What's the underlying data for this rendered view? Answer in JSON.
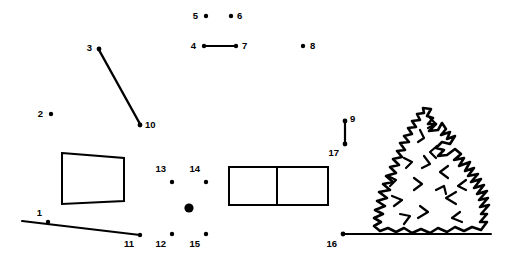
{
  "image": {
    "title": "Connect-the-dots puzzle worksheet",
    "subject": "evergreen pine tree with numbered dots",
    "width": 516,
    "height": 264,
    "background_color": "#ffffff",
    "ink_color": "#000000"
  },
  "dots": [
    {
      "number": "1",
      "x": 48,
      "y": 222,
      "label_x": 42,
      "label_y": 216,
      "r": 2.2
    },
    {
      "number": "2",
      "x": 51,
      "y": 114,
      "label_x": 43,
      "label_y": 117,
      "r": 2.2
    },
    {
      "number": "3",
      "x": 99,
      "y": 49,
      "label_x": 92,
      "label_y": 51,
      "r": 2.4
    },
    {
      "number": "4",
      "x": 204,
      "y": 46,
      "label_x": 196,
      "label_y": 49,
      "r": 2.2
    },
    {
      "number": "5",
      "x": 206,
      "y": 16,
      "label_x": 198,
      "label_y": 19,
      "r": 2.2
    },
    {
      "number": "6",
      "x": 231,
      "y": 16,
      "label_x": 237,
      "label_y": 19,
      "r": 2.2
    },
    {
      "number": "7",
      "x": 236,
      "y": 46,
      "label_x": 242,
      "label_y": 49,
      "r": 2.2
    },
    {
      "number": "8",
      "x": 303,
      "y": 46,
      "label_x": 310,
      "label_y": 49,
      "r": 2.2
    },
    {
      "number": "9",
      "x": 345,
      "y": 121,
      "label_x": 350,
      "label_y": 122,
      "r": 2.4
    },
    {
      "number": "10",
      "x": 140,
      "y": 125,
      "label_x": 145,
      "label_y": 128,
      "r": 2.4
    },
    {
      "number": "11",
      "x": 140,
      "y": 235,
      "label_x": 134,
      "label_y": 247,
      "r": 2.2
    },
    {
      "number": "12",
      "x": 172,
      "y": 234,
      "label_x": 166,
      "label_y": 247,
      "r": 2.2
    },
    {
      "number": "13",
      "x": 172,
      "y": 182,
      "label_x": 166,
      "label_y": 172,
      "r": 2.2
    },
    {
      "number": "14",
      "x": 206,
      "y": 182,
      "label_x": 200,
      "label_y": 172,
      "r": 2.2
    },
    {
      "number": "15",
      "x": 206,
      "y": 234,
      "label_x": 200,
      "label_y": 247,
      "r": 2.2
    },
    {
      "number": "16",
      "x": 343,
      "y": 234,
      "label_x": 337,
      "label_y": 247,
      "r": 2.4
    },
    {
      "number": "17",
      "x": 345,
      "y": 144,
      "label_x": 339,
      "label_y": 156,
      "r": 2.4
    }
  ],
  "unnumbered_marks": [
    {
      "name": "large-center-dot",
      "x": 189,
      "y": 208,
      "r": 4.6
    }
  ],
  "connector_lines": [
    {
      "name": "line-3-to-10",
      "from": "3",
      "to": "10",
      "x1": 99,
      "y1": 50,
      "x2": 140,
      "y2": 124,
      "width": 2.4
    },
    {
      "name": "line-4-to-7",
      "from": "4",
      "to": "7",
      "x1": 205,
      "y1": 46,
      "x2": 235,
      "y2": 46,
      "width": 2.2
    },
    {
      "name": "line-9-to-17",
      "from": "9",
      "to": "17",
      "x1": 345,
      "y1": 122,
      "x2": 345,
      "y2": 143,
      "width": 2.2
    }
  ],
  "free_lines": [
    {
      "name": "ground-line-left",
      "x1": 22,
      "y1": 221,
      "x2": 140,
      "y2": 235,
      "width": 2.0
    },
    {
      "name": "ground-line-right",
      "x1": 343,
      "y1": 234,
      "x2": 491,
      "y2": 234,
      "width": 2.0
    }
  ],
  "shapes": [
    {
      "name": "quadrilateral-left",
      "type": "polygon",
      "points": "62,153 124,158 124,201 62,204",
      "stroke_width": 2.0
    },
    {
      "name": "rectangle-right",
      "type": "rect",
      "x": 229,
      "y": 167,
      "width": 99,
      "height": 38,
      "stroke_width": 2.0
    },
    {
      "name": "rectangle-right-divider",
      "type": "line",
      "x1": 277,
      "y1": 167,
      "x2": 277,
      "y2": 205,
      "stroke_width": 2.0
    }
  ],
  "tree": {
    "name": "pine-tree-illustration",
    "description": "hand-drawn evergreen conifer with layered jagged foliage",
    "bounds": {
      "x": 372,
      "y": 108,
      "width": 118,
      "height": 128
    },
    "stroke_width": 2.6,
    "outline_path": "M431,109 L427,116 L433,118 L428,124 L436,124 L429,131 L438,130 L442,123 L446,129 L441,135 L450,132 L447,139 L455,136 L450,144 L442,142 L436,148 L444,150 L438,156 L447,155 L455,149 L461,154 L454,160 L464,158 L459,166 L470,162 L465,171 L474,168 L468,176 L478,174 L471,182 L481,179 L474,188 L484,185 L477,194 L487,191 L479,200 L488,198 L480,207 L489,205 L481,214 L487,214 L480,222 L487,222 L481,230 L472,227 L464,231 L455,227 L447,232 L438,228 L430,233 L421,229 L412,233 L404,228 L396,232 L388,228 L380,231 L374,226 L381,222 L374,218 L383,214 L375,210 L385,206 L377,201 L387,198 L379,192 L390,190 L383,184 L393,182 L386,176 L396,173 L390,167 L399,165 L393,159 L402,157 L397,151 L405,150 L400,143 L409,142 L404,136 L412,134 L408,128 L416,127 L412,121 L420,120 L417,114 L424,113 L423,108 Z",
    "inner_marks": [
      "M420,130 L424,138 L418,142",
      "M437,146 L430,152 L436,158",
      "M404,158 L412,162 L406,168",
      "M448,166 L440,172 L448,178",
      "M414,178 L422,184 L414,190",
      "M392,196 L402,200 L394,206",
      "M456,192 L446,198 L456,204",
      "M420,206 L428,212 L418,218",
      "M436,190 L444,186 L446,194",
      "M400,214 L410,216 L404,224",
      "M460,212 L452,218 L462,222",
      "M424,156 L430,164 L422,168",
      "M388,176 L396,180 L390,186",
      "M466,180 L458,186 L466,190",
      "M430,118 L436,124 L428,128"
    ]
  }
}
